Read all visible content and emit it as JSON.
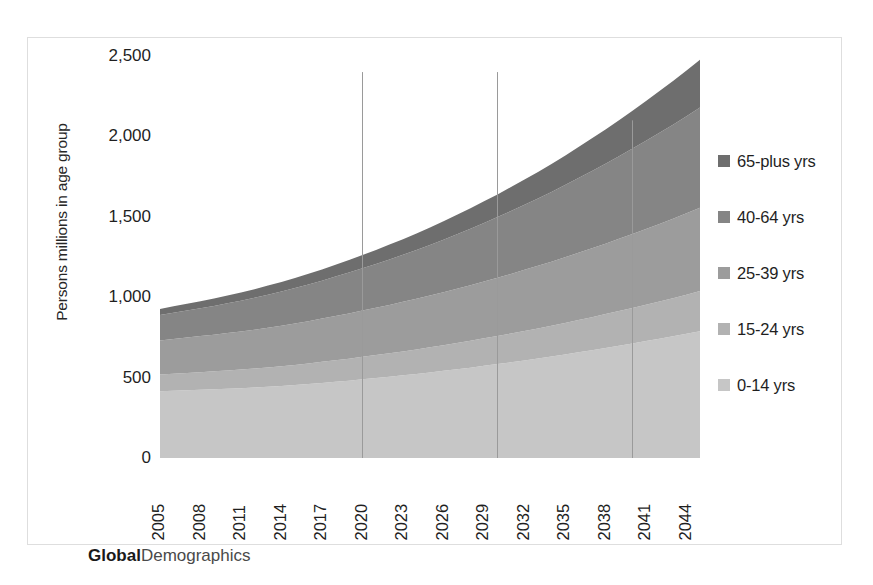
{
  "chart_data": {
    "type": "area",
    "stacked": true,
    "title": "",
    "subtitle": "",
    "xlabel": "",
    "ylabel": "Persons millions in age group",
    "ylim": [
      0,
      2500
    ],
    "ytick_labels": [
      "2,500",
      "2,000",
      "1,500",
      "1,000",
      "500",
      "0"
    ],
    "ytick_values": [
      2500,
      2000,
      1500,
      1000,
      500,
      0
    ],
    "grid": false,
    "legend_position": "right",
    "xtick_labels": [
      "2005",
      "2008",
      "2011",
      "2014",
      "2017",
      "2020",
      "2023",
      "2026",
      "2029",
      "2032",
      "2035",
      "2038",
      "2041",
      "2044"
    ],
    "x": [
      2005,
      2006,
      2007,
      2008,
      2009,
      2010,
      2011,
      2012,
      2013,
      2014,
      2015,
      2016,
      2017,
      2018,
      2019,
      2020,
      2021,
      2022,
      2023,
      2024,
      2025,
      2026,
      2027,
      2028,
      2029,
      2030,
      2031,
      2032,
      2033,
      2034,
      2035,
      2036,
      2037,
      2038,
      2039,
      2040,
      2041,
      2042,
      2043,
      2044,
      2045
    ],
    "series": [
      {
        "name": "0-14 yrs",
        "color": "#c6c6c6",
        "values": [
          415,
          418,
          421,
          424,
          427,
          430,
          434,
          438,
          443,
          448,
          454,
          460,
          467,
          474,
          481,
          489,
          497,
          505,
          514,
          523,
          532,
          542,
          552,
          562,
          573,
          584,
          595,
          607,
          619,
          631,
          644,
          657,
          670,
          684,
          698,
          712,
          727,
          742,
          757,
          773,
          789
        ]
      },
      {
        "name": "15-24 yrs",
        "color": "#b2b2b2",
        "values": [
          104,
          106,
          108,
          110,
          112,
          114,
          116,
          118,
          120,
          123,
          125,
          128,
          131,
          134,
          137,
          140,
          143,
          146,
          149,
          152,
          156,
          159,
          163,
          167,
          171,
          175,
          179,
          183,
          187,
          192,
          196,
          201,
          206,
          211,
          216,
          221,
          226,
          232,
          237,
          243,
          249
        ]
      },
      {
        "name": "25-39 yrs",
        "color": "#9c9c9c",
        "values": [
          212,
          216,
          220,
          224,
          228,
          233,
          237,
          242,
          247,
          252,
          258,
          263,
          269,
          275,
          281,
          288,
          294,
          301,
          308,
          315,
          322,
          330,
          338,
          346,
          354,
          362,
          371,
          380,
          389,
          398,
          408,
          418,
          428,
          438,
          449,
          460,
          471,
          482,
          494,
          506,
          518
        ]
      },
      {
        "name": "40-64 yrs",
        "color": "#858585",
        "values": [
          158,
          163,
          168,
          173,
          179,
          185,
          191,
          198,
          205,
          212,
          220,
          228,
          236,
          245,
          254,
          263,
          273,
          283,
          293,
          304,
          315,
          327,
          339,
          351,
          364,
          377,
          391,
          405,
          419,
          434,
          449,
          465,
          481,
          497,
          514,
          531,
          549,
          567,
          585,
          604,
          623
        ]
      },
      {
        "name": "65-plus yrs",
        "color": "#6e6e6e",
        "values": [
          38,
          40,
          42,
          44,
          46,
          48,
          51,
          54,
          57,
          60,
          63,
          67,
          70,
          74,
          78,
          82,
          87,
          92,
          97,
          102,
          108,
          114,
          120,
          127,
          134,
          141,
          149,
          157,
          165,
          174,
          183,
          193,
          203,
          213,
          224,
          235,
          247,
          259,
          271,
          284,
          297
        ]
      }
    ],
    "reference_lines": [
      {
        "x": 2020,
        "top_value": 2400
      },
      {
        "x": 2030,
        "top_value": 2400
      },
      {
        "x": 2040,
        "top_value": 2100
      }
    ]
  },
  "legend": {
    "items": [
      {
        "label": "65-plus yrs",
        "color": "#6e6e6e"
      },
      {
        "label": "40-64 yrs",
        "color": "#858585"
      },
      {
        "label": "25-39 yrs",
        "color": "#9c9c9c"
      },
      {
        "label": "15-24 yrs",
        "color": "#b2b2b2"
      },
      {
        "label": "0-14 yrs",
        "color": "#c6c6c6"
      }
    ]
  },
  "watermark": {
    "bold_part": "Global",
    "rest_part": "Demographics"
  }
}
